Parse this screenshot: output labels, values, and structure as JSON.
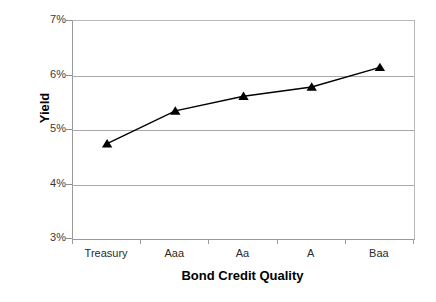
{
  "chart_data": {
    "type": "line",
    "title": "",
    "xlabel": "Bond Credit Quality",
    "ylabel": "Yield",
    "categories": [
      "Treasury",
      "Aaa",
      "Aa",
      "A",
      "Baa"
    ],
    "values": [
      4.75,
      5.35,
      5.62,
      5.79,
      6.15
    ],
    "series": [
      {
        "name": "Yield",
        "values": [
          4.75,
          5.35,
          5.62,
          5.79,
          6.15
        ],
        "marker": "triangle",
        "marker_color": "#000000",
        "line_color": "#000000"
      }
    ],
    "ylim": [
      3,
      7
    ],
    "y_ticks": [
      3,
      4,
      5,
      6,
      7
    ],
    "y_tick_labels": [
      "3%",
      "4%",
      "5%",
      "6%",
      "7%"
    ],
    "grid": "horizontal",
    "gridline_color": "#a9a9a9",
    "legend": "none",
    "plot_border_color": "#9a9a9a",
    "background": "#ffffff"
  },
  "axes": {
    "y_title": "Yield",
    "x_title": "Bond Credit Quality"
  }
}
